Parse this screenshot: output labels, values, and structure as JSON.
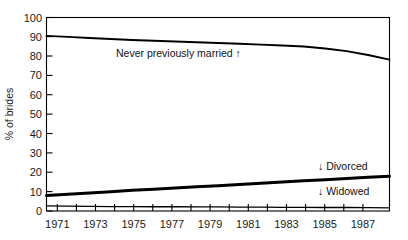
{
  "chart_data": {
    "type": "line",
    "title": "",
    "xlabel": "",
    "ylabel": "% of brides",
    "xlim": [
      1971,
      1987
    ],
    "ylim": [
      0,
      100
    ],
    "ytick_step": 10,
    "grid": false,
    "legend_position": "inline-annotations",
    "yticks": [
      "0",
      "10",
      "20",
      "30",
      "40",
      "50",
      "60",
      "70",
      "80",
      "90",
      "100"
    ],
    "xticks": [
      "1971",
      "1973",
      "1975",
      "1977",
      "1979",
      "1981",
      "1983",
      "1985",
      "1987"
    ],
    "x": [
      1971,
      1972,
      1973,
      1974,
      1975,
      1976,
      1977,
      1978,
      1979,
      1980,
      1981,
      1982,
      1983,
      1984,
      1985,
      1986,
      1987
    ],
    "series": [
      {
        "name": "Never previously married",
        "annotation": "Never previously married ↑",
        "values": [
          90.5,
          90.0,
          89.4,
          88.9,
          88.4,
          88.0,
          87.6,
          87.2,
          86.8,
          86.4,
          86.0,
          85.5,
          85.0,
          84.0,
          82.6,
          80.6,
          78.2
        ]
      },
      {
        "name": "Divorced",
        "annotation": "↓ Divorced",
        "values": [
          8.0,
          8.6,
          9.3,
          10.0,
          10.7,
          11.3,
          11.9,
          12.5,
          13.1,
          13.7,
          14.3,
          15.0,
          15.6,
          16.2,
          16.8,
          17.4,
          18.0
        ]
      },
      {
        "name": "Widowed",
        "annotation": "↓ Widowed",
        "values": [
          2.6,
          2.5,
          2.4,
          2.3,
          2.3,
          2.2,
          2.2,
          2.1,
          2.1,
          2.0,
          2.0,
          1.9,
          1.9,
          1.8,
          1.8,
          1.7,
          1.6
        ]
      }
    ],
    "annotations": [
      {
        "text": "Never previously married ↑",
        "series": "Never previously married"
      },
      {
        "text": "↓ Divorced",
        "series": "Divorced"
      },
      {
        "text": "↓ Widowed",
        "series": "Widowed"
      }
    ],
    "colors": {
      "line": "#000000",
      "text": "#1a1a1a",
      "background": "#ffffff"
    }
  },
  "header": {
    "cropped_text": "· · · ·"
  }
}
